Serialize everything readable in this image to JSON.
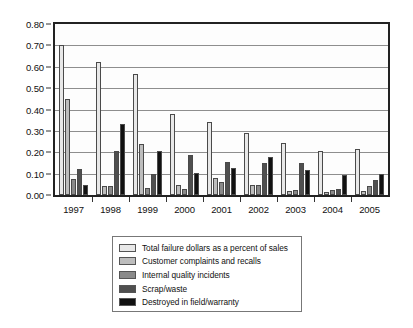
{
  "chart_data": {
    "type": "bar",
    "title": "",
    "subtitle": "",
    "xlabel": "",
    "ylabel": "",
    "categories": [
      "1997",
      "1998",
      "1999",
      "2000",
      "2001",
      "2002",
      "2003",
      "2004",
      "2005"
    ],
    "ylim": [
      0.0,
      0.8
    ],
    "ytick_labels": [
      "0.00",
      "0.10",
      "0.20",
      "0.30",
      "0.40",
      "0.50",
      "0.60",
      "0.70",
      "0.80"
    ],
    "ytick_values": [
      0.0,
      0.1,
      0.2,
      0.3,
      0.4,
      0.5,
      0.6,
      0.7,
      0.8
    ],
    "grid": true,
    "grid_axis": "y",
    "legend_position": "below-center",
    "bar_mode": "grouped",
    "series": [
      {
        "name": "Total failure dollars as a percent of sales",
        "color": "#e8e8e8",
        "values": [
          0.7,
          0.62,
          0.565,
          0.38,
          0.34,
          0.29,
          0.245,
          0.205,
          0.215
        ]
      },
      {
        "name": "Customer complaints and recalls",
        "color": "#bdbdbd",
        "values": [
          0.45,
          0.04,
          0.24,
          0.045,
          0.08,
          0.045,
          0.02,
          0.015,
          0.02
        ]
      },
      {
        "name": "Internal quality incidents",
        "color": "#8a8a8a",
        "values": [
          0.075,
          0.04,
          0.035,
          0.03,
          0.06,
          0.045,
          0.025,
          0.025,
          0.04
        ]
      },
      {
        "name": "Scrap/waste",
        "color": "#4f4f4f",
        "values": [
          0.12,
          0.205,
          0.1,
          0.185,
          0.155,
          0.15,
          0.15,
          0.03,
          0.07
        ]
      },
      {
        "name": "Destroyed in field/warranty",
        "color": "#111111",
        "values": [
          0.045,
          0.33,
          0.205,
          0.105,
          0.125,
          0.18,
          0.115,
          0.095,
          0.1
        ]
      }
    ]
  }
}
